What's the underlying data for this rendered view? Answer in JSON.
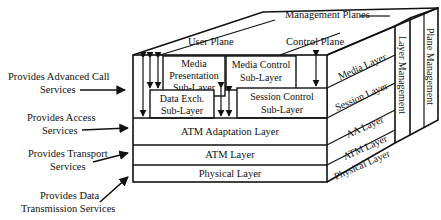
{
  "diagram": {
    "type": "3d-layered-protocol-cube",
    "top_label": "Management Planes",
    "planes": {
      "user": "User Plane",
      "control": "Control Plane"
    },
    "sub_layers": {
      "media_presentation": [
        "Media",
        "Presentation",
        "Sub-Layer"
      ],
      "data_exchange": [
        "Data Exch.",
        "Sub-Layer"
      ],
      "media_control": [
        "Media Control",
        "Sub-Layer"
      ],
      "session_control": [
        "Session Control",
        "Sub-Layer"
      ]
    },
    "front_layers": [
      "ATM Adaptation Layer",
      "ATM  Layer",
      "Physical Layer"
    ],
    "side_layers": [
      "Media Layer",
      "Session Layer",
      "AA Layer",
      "ATM Layer",
      "Physical Layer"
    ],
    "management_columns": [
      "Layer Management",
      "Plane Management"
    ],
    "left_annotations": [
      {
        "line1": "Provides Advanced Call",
        "line2": "Services"
      },
      {
        "line1": "Provides Access",
        "line2": "Services"
      },
      {
        "line1": "Provides Transport",
        "line2": "Services"
      },
      {
        "line1": "Provides Data",
        "line2": "Transmission Services"
      }
    ]
  }
}
